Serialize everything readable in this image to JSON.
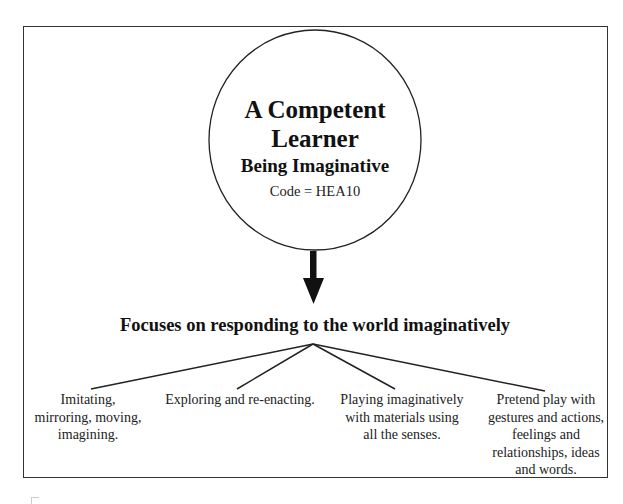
{
  "diagram": {
    "root": {
      "title_line1": "A Competent",
      "title_line2": "Learner",
      "subtitle": "Being Imaginative",
      "code": "Code = HEA10"
    },
    "focus_heading": "Focuses on responding to the world imaginatively",
    "branches": [
      {
        "lines": [
          "Imitating,",
          "mirroring, moving,",
          "imagining."
        ]
      },
      {
        "lines": [
          "Exploring and re-enacting."
        ]
      },
      {
        "lines": [
          "Playing imaginatively",
          "with materials using",
          "all the senses."
        ]
      },
      {
        "lines": [
          "Pretend play with",
          "gestures and actions,",
          "feelings and",
          "relationships, ideas",
          "and words."
        ]
      }
    ],
    "colors": {
      "line": "#222222",
      "text": "#111111",
      "background": "#ffffff"
    }
  }
}
